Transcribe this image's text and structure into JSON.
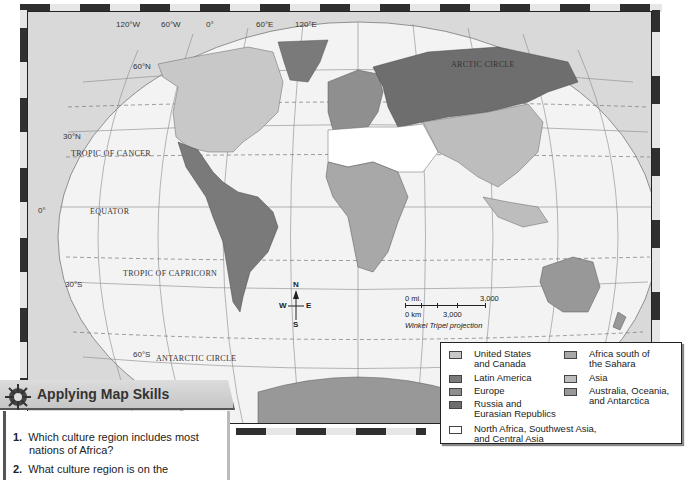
{
  "map": {
    "longitude_labels": [
      "120°W",
      "60°W",
      "0°",
      "60°E",
      "120°E"
    ],
    "latitude_labels": [
      "60°N",
      "30°N",
      "0°",
      "30°S",
      "60°S"
    ],
    "line_labels": {
      "arctic_circle": "ARCTIC CIRCLE",
      "tropic_of_cancer": "TROPIC OF CANCER",
      "equator": "EQUATOR",
      "tropic_of_capricorn": "TROPIC OF CAPRICORN",
      "antarctic_circle": "ANTARCTIC CIRCLE"
    },
    "compass": {
      "n": "N",
      "s": "S",
      "e": "E",
      "w": "W"
    },
    "scale": {
      "mi_start": "0 mi.",
      "mi_end": "3,000",
      "km_start": "0 km",
      "km_end": "3,000",
      "projection": "Winkel Tripel projection"
    }
  },
  "legend": {
    "items": [
      {
        "label": "United States and Canada",
        "line1": "United States",
        "line2": "and Canada",
        "color": "#c8c8c8"
      },
      {
        "label": "Latin America",
        "line1": "Latin America",
        "line2": "",
        "color": "#7a7a7a"
      },
      {
        "label": "Europe",
        "line1": "Europe",
        "line2": "",
        "color": "#8f8f8f"
      },
      {
        "label": "Russia and Eurasian Republics",
        "line1": "Russia and",
        "line2": "Eurasian Republics",
        "color": "#6e6e6e"
      },
      {
        "label": "Africa south of the Sahara",
        "line1": "Africa south of",
        "line2": "the Sahara",
        "color": "#a8a8a8"
      },
      {
        "label": "Asia",
        "line1": "Asia",
        "line2": "",
        "color": "#bdbdbd"
      },
      {
        "label": "Australia, Oceania, and Antarctica",
        "line1": "Australia, Oceania,",
        "line2": "and Antarctica",
        "color": "#989898"
      },
      {
        "label": "North Africa, Southwest Asia, and Central Asia",
        "line1": "North Africa, Southwest Asia,",
        "line2": "and Central Asia",
        "color": "#ffffff"
      }
    ]
  },
  "skills": {
    "title": "Applying Map Skills",
    "questions": [
      {
        "num": "1.",
        "line1": "Which culture region includes most",
        "line2": "nations of Africa?"
      },
      {
        "num": "2.",
        "line1": "What culture region is on the",
        "line2": ""
      }
    ]
  },
  "colors": {
    "ocean": "#f2f2f2",
    "outside": "#d9d9d9",
    "frame_dark": "#2f2f2f"
  }
}
